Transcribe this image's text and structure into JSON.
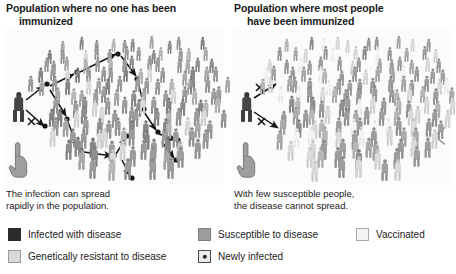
{
  "figure": {
    "type": "scientific-illustration",
    "background_color": "#ffffff"
  },
  "panels": [
    {
      "id": "a",
      "label": "(a)",
      "title_line1": "Population where no one has been",
      "title_line2": "immunized",
      "caption_line1": "The infection can spread",
      "caption_line2": "rapidly in the population.",
      "stage_background": "#fbfbfa",
      "crowd_count": 128,
      "source_case": {
        "name": "infected-individual",
        "color": "#454545"
      },
      "transmission": {
        "successful_arrows": 11,
        "blocked_arrows": 1,
        "newly_infected_dots": 13,
        "blocked_marker": "X"
      },
      "hand_icon": "pointing-hand-icon"
    },
    {
      "id": "b",
      "label": "(b)",
      "title_line1": "Population where most people",
      "title_line2": "have been immunized",
      "caption_line1": "With few susceptible people,",
      "caption_line2": "the disease cannot spread.",
      "stage_background": "#fbfbfa",
      "crowd_count": 128,
      "source_case": {
        "name": "infected-individual",
        "color": "#454545"
      },
      "transmission": {
        "successful_arrows": 0,
        "blocked_arrows": 2,
        "newly_infected_dots": 0,
        "blocked_marker": "X"
      },
      "hand_icon": "pointing-hand-icon",
      "edge_marker": "left-pointing-triangle"
    }
  ],
  "legend": {
    "items": [
      {
        "key": "infected",
        "label": "Infected with disease",
        "color": "#2b2b2b",
        "border": "#2b2b2b",
        "marker": "none"
      },
      {
        "key": "resistant",
        "label": "Genetically resistant to disease",
        "color": "#d9dbd9",
        "border": "#9a9c9a",
        "marker": "none"
      },
      {
        "key": "susceptible",
        "label": "Susceptible to disease",
        "color": "#9b9d9b",
        "border": "#7c7e7c",
        "marker": "none"
      },
      {
        "key": "newly",
        "label": "Newly infected",
        "color": "#ebecea",
        "border": "#4a4a4a",
        "marker": "dot"
      },
      {
        "key": "vaccinated",
        "label": "Vaccinated",
        "color": "#f4f5f3",
        "border": "#a8aaa8",
        "marker": "none"
      }
    ]
  },
  "colors": {
    "infected": "#2b2b2b",
    "susceptible": "#9b9d9b",
    "resistant": "#d9dbd9",
    "vaccinated": "#f4f5f3",
    "newly_infected_dot": "#262626",
    "arrow": "#1c1c1c",
    "text": "#1a1a1a"
  }
}
